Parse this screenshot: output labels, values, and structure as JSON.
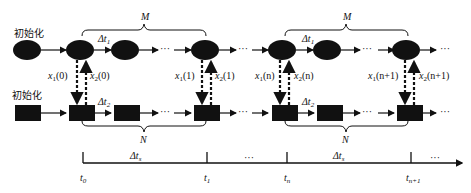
{
  "diagram": {
    "top_row": {
      "init_label": "初始化",
      "dt_label": "Δt",
      "dt_sub": "1",
      "brace_label": "M"
    },
    "bottom_row": {
      "init_label": "初始化",
      "dt_label": "Δt",
      "dt_sub": "2",
      "brace_label": "N"
    },
    "exchange_labels": [
      {
        "var": "x",
        "sub": "1",
        "arg": "(0)"
      },
      {
        "var": "x",
        "sub": "2",
        "arg": "(0)"
      },
      {
        "var": "x",
        "sub": "1",
        "arg": "(1)"
      },
      {
        "var": "x",
        "sub": "2",
        "arg": "(1)"
      },
      {
        "var": "x",
        "sub": "1",
        "arg": "(n)"
      },
      {
        "var": "x",
        "sub": "2",
        "arg": "(n)"
      },
      {
        "var": "x",
        "sub": "1",
        "arg": "(n+1)"
      },
      {
        "var": "x",
        "sub": "2",
        "arg": "(n+1)"
      }
    ],
    "ellipsis": "···",
    "timeline": {
      "interval_label": "Δt",
      "interval_sub": "s",
      "ticks": [
        {
          "t": "t",
          "sub": "0"
        },
        {
          "t": "t",
          "sub": "1"
        },
        {
          "t": "t",
          "sub": "n"
        },
        {
          "t": "t",
          "sub": "n+1"
        }
      ],
      "ellipsis": "···"
    }
  }
}
